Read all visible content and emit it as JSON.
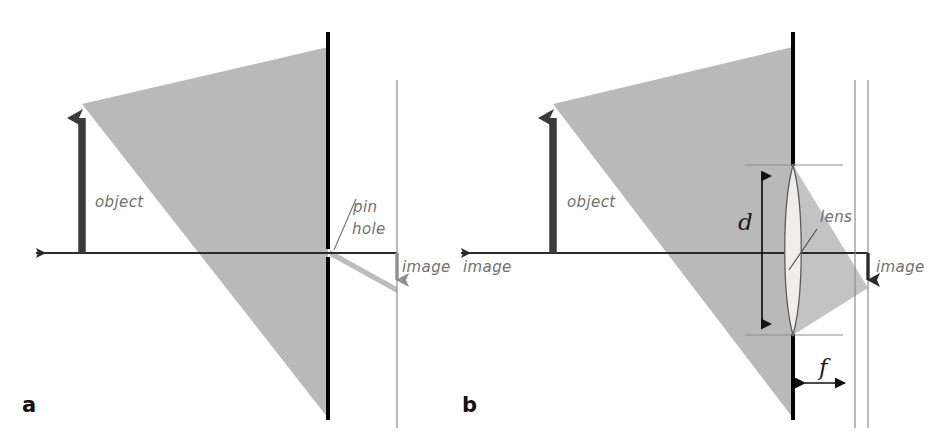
{
  "figure": {
    "width": 946,
    "height": 443,
    "background": "#ffffff"
  },
  "colors": {
    "cone_gray": "#b9b9b9",
    "cone_gray_light": "#c6c6c6",
    "barrier_black": "#000000",
    "screen_gray": "#8d8d8d",
    "object_arrow": "#3a3a3a",
    "image_arrow_a": "#9a9a9a",
    "image_arrow_b": "#2b2b2b",
    "axis": "#2b2b2b",
    "label_gray": "#6f6f6f",
    "lens_fill": "#efeeea",
    "lens_stroke": "#5d5d5d",
    "dimension_line": "#111111",
    "tick_gray": "#8d8d8d"
  },
  "panels": [
    {
      "id": "a",
      "letter": "a",
      "letter_pos": {
        "x": 22,
        "y": 412
      },
      "type": "pinhole",
      "labels": {
        "object": "object",
        "pinhole_line1": "pin",
        "pinhole_line2": "hole",
        "image": "image"
      }
    },
    {
      "id": "b",
      "letter": "b",
      "letter_pos": {
        "x": 462,
        "y": 412
      },
      "type": "lens",
      "labels": {
        "object": "object",
        "lens": "lens",
        "image_left": "image",
        "image_right": "image",
        "diameter": "d",
        "focal_length": "f"
      }
    }
  ],
  "geometry_a": {
    "axis_y": 253,
    "axis_x_start": 30,
    "axis_x_end": 412,
    "object_x": 82,
    "object_top_y": 104,
    "object_base_y": 253,
    "barrier_x": 328,
    "barrier_top_y": 32,
    "barrier_bottom_y": 420,
    "pinhole_y": 253,
    "screen_x": 397,
    "screen_top_y": 80,
    "screen_bottom_y": 428,
    "cone_apex_x": 82,
    "cone_apex_y": 104,
    "cone_top_y": 47,
    "cone_bottom_y": 418,
    "image_tip_y": 290,
    "object_label_pos": {
      "x": 95,
      "y": 207
    },
    "pin_label_pos": {
      "x": 353,
      "y": 212
    },
    "hole_label_pos": {
      "x": 352,
      "y": 232
    },
    "image_label_pos": {
      "x": 402,
      "y": 272
    },
    "leader_from": {
      "x": 334,
      "y": 250
    },
    "leader_to": {
      "x": 354,
      "y": 200
    }
  },
  "geometry_b": {
    "axis_y": 253,
    "axis_x_start": 455,
    "axis_x_end": 880,
    "object_x": 553,
    "object_top_y": 104,
    "object_base_y": 253,
    "barrier_x": 793,
    "barrier_top_y": 32,
    "barrier_bottom_y": 420,
    "screen1_x": 855,
    "screen2_x": 868,
    "screen_top_y": 80,
    "screen_bottom_y": 428,
    "cone_apex_x": 553,
    "cone_apex_y": 104,
    "cone_top_y": 47,
    "cone_bottom_y": 418,
    "lens_cx": 793,
    "lens_top_y": 165,
    "lens_bottom_y": 335,
    "lens_half_width": 11,
    "d_arrow_x": 762,
    "d_top_y": 165,
    "d_bottom_y": 333,
    "d_label_pos": {
      "x": 742,
      "y": 222
    },
    "f_arrow_y": 383,
    "f_x_start": 797,
    "f_x_end": 853,
    "f_label_pos": {
      "x": 820,
      "y": 375
    },
    "image_arrow_x": 868,
    "image_tip_y": 290,
    "object_label_pos": {
      "x": 567,
      "y": 207
    },
    "lens_label_pos": {
      "x": 820,
      "y": 222
    },
    "lens_leader_from": {
      "x": 818,
      "y": 228
    },
    "lens_leader_to": {
      "x": 790,
      "y": 268
    },
    "image_left_label_pos": {
      "x": 463,
      "y": 272
    },
    "image_right_label_pos": {
      "x": 876,
      "y": 272
    }
  }
}
